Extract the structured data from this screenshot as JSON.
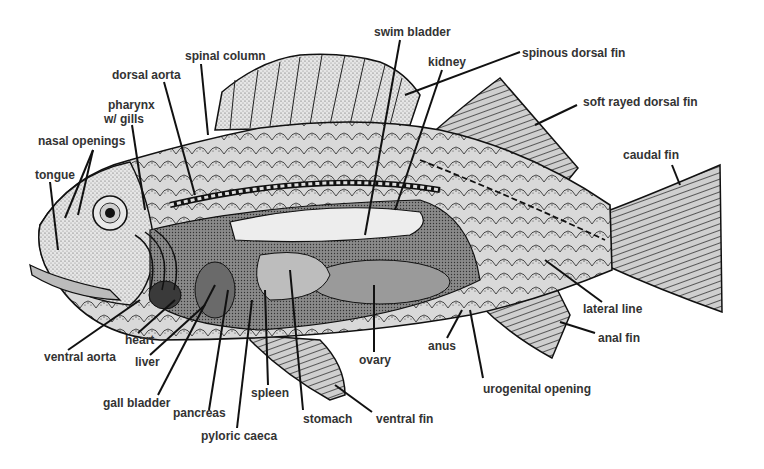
{
  "diagram": {
    "labels": {
      "swim_bladder": "swim bladder",
      "spinous_dorsal_fin": "spinous dorsal fin",
      "spinal_column": "spinal column",
      "kidney": "kidney",
      "dorsal_aorta": "dorsal aorta",
      "soft_rayed_dorsal_fin": "soft rayed dorsal fin",
      "pharynx_line1": "pharynx",
      "pharynx_line2": "w/ gills",
      "nasal_openings": "nasal openings",
      "caudal_fin": "caudal fin",
      "tongue": "tongue",
      "lateral_line": "lateral line",
      "heart": "heart",
      "anal_fin": "anal fin",
      "ventral_aorta": "ventral aorta",
      "liver": "liver",
      "anus": "anus",
      "ovary": "ovary",
      "spleen": "spleen",
      "urogenital_opening": "urogenital opening",
      "gall_bladder": "gall bladder",
      "pancreas": "pancreas",
      "stomach": "stomach",
      "ventral_fin": "ventral fin",
      "pyloric_caeca": "pyloric caeca"
    },
    "colors": {
      "background": "#ffffff",
      "label_text": "#333333",
      "ink": "#111111"
    }
  }
}
